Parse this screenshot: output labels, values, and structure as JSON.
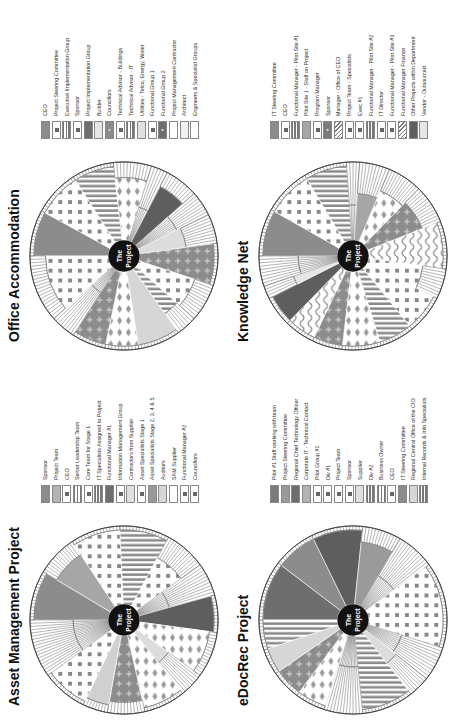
{
  "panels": [
    {
      "id": "asset",
      "title": "Asset Management Project",
      "center_label": [
        "The",
        "Project"
      ],
      "legend": [
        {
          "label": "Sponsor",
          "pattern": "solid",
          "color": "#8c8c8c"
        },
        {
          "label": "Project Team",
          "pattern": "solid",
          "color": "#b3b3b3"
        },
        {
          "label": "CEO",
          "pattern": "cross",
          "color": "#ffffff"
        },
        {
          "label": "Senior Leadership Team",
          "pattern": "hlines",
          "color": "#ffffff"
        },
        {
          "label": "Core Team for Stage 1",
          "pattern": "cross",
          "color": "#ffffff"
        },
        {
          "label": "IT Specialists Assigned to Project",
          "pattern": "hlines",
          "color": "#ffffff"
        },
        {
          "label": "Functional Manager #1",
          "pattern": "solid",
          "color": "#6e6e6e"
        },
        {
          "label": "Information Management Group",
          "pattern": "cross",
          "color": "#ffffff"
        },
        {
          "label": "Contractors from Supplier",
          "pattern": "solid",
          "color": "#e0e0e0"
        },
        {
          "label": "Asset Specialists Stage 1",
          "pattern": "cross",
          "color": "#ffffff"
        },
        {
          "label": "Asset Specialists Stage 2, 3, 4 & 5",
          "pattern": "solid",
          "color": "#999999"
        },
        {
          "label": "Auditors",
          "pattern": "solid",
          "color": "#d6d6d6"
        },
        {
          "label": "SAM Supplier",
          "pattern": "blank",
          "color": "#ffffff"
        },
        {
          "label": "Functional Manager #2",
          "pattern": "cross",
          "color": "#ffffff"
        },
        {
          "label": "Councillors",
          "pattern": "cross",
          "color": "#ffffff"
        }
      ],
      "wedges": [
        {
          "color": "#8c8c8c",
          "pattern": "solid",
          "span": 1.2,
          "depth": 0.95
        },
        {
          "color": "#a6a6a6",
          "pattern": "solid",
          "span": 1.0,
          "depth": 0.8
        },
        {
          "color": "#ffffff",
          "pattern": "dots",
          "span": 1.2,
          "depth": 0.95
        },
        {
          "color": "#9a9a9a",
          "pattern": "vlines",
          "span": 1.2,
          "depth": 0.95
        },
        {
          "color": "#ffffff",
          "pattern": "dots",
          "span": 1.0,
          "depth": 0.7
        },
        {
          "color": "#ffffff",
          "pattern": "hatch",
          "span": 0.8,
          "depth": 0.4
        },
        {
          "color": "#5e5e5e",
          "pattern": "solid",
          "span": 0.9,
          "depth": 0.95
        },
        {
          "color": "#ffffff",
          "pattern": "arrows",
          "span": 1.1,
          "depth": 0.9
        },
        {
          "color": "#dcdcdc",
          "pattern": "solid",
          "span": 0.6,
          "depth": 0.5
        },
        {
          "color": "#ffffff",
          "pattern": "arrows",
          "span": 1.0,
          "depth": 0.95
        },
        {
          "color": "#a0a0a0",
          "pattern": "plus",
          "span": 0.9,
          "depth": 0.85
        },
        {
          "color": "#d0d0d0",
          "pattern": "solid",
          "span": 0.6,
          "depth": 0.9
        },
        {
          "color": "#ffffff",
          "pattern": "dots",
          "span": 1.1,
          "depth": 0.95
        },
        {
          "color": "#ffffff",
          "pattern": "hatch",
          "span": 1.4,
          "depth": 0.45
        }
      ]
    },
    {
      "id": "office",
      "title": "Office Accommodation",
      "center_label": [
        "The",
        "Project"
      ],
      "legend": [
        {
          "label": "CEO",
          "pattern": "solid",
          "color": "#8c8c8c"
        },
        {
          "label": "Project Steering Committee",
          "pattern": "cross",
          "color": "#ffffff"
        },
        {
          "label": "Executive Implementation Group",
          "pattern": "hlines",
          "color": "#ffffff"
        },
        {
          "label": "Sponsor",
          "pattern": "cross",
          "color": "#ffffff"
        },
        {
          "label": "Project Implementation Group",
          "pattern": "solid",
          "color": "#6e6e6e"
        },
        {
          "label": "Builder",
          "pattern": "solid",
          "color": "#e6e6e6"
        },
        {
          "label": "Councillors",
          "pattern": "plus",
          "color": "#8c8c8c"
        },
        {
          "label": "Technical Advisor - Buildings",
          "pattern": "cross",
          "color": "#ffffff"
        },
        {
          "label": "Technical Advisor - IT",
          "pattern": "hlines",
          "color": "#ffffff"
        },
        {
          "label": "Utilities - Telco, Energy, Water",
          "pattern": "solid",
          "color": "#e0e0e0"
        },
        {
          "label": "Functional Group 1",
          "pattern": "cross",
          "color": "#ffffff"
        },
        {
          "label": "Functional Group 2",
          "pattern": "plus",
          "color": "#6e6e6e"
        },
        {
          "label": "Project Management Contractor",
          "pattern": "blank",
          "color": "#ffffff"
        },
        {
          "label": "Architect",
          "pattern": "blank",
          "color": "#f0f0f0"
        },
        {
          "label": "Engineers & Specialist Groups",
          "pattern": "blank",
          "color": "#ffffff"
        }
      ],
      "wedges": [
        {
          "color": "#8c8c8c",
          "pattern": "solid",
          "span": 1.1,
          "depth": 0.95
        },
        {
          "color": "#ffffff",
          "pattern": "dots",
          "span": 1.1,
          "depth": 0.95
        },
        {
          "color": "#9a9a9a",
          "pattern": "vlines",
          "span": 1.0,
          "depth": 0.95
        },
        {
          "color": "#ffffff",
          "pattern": "arrows",
          "span": 0.9,
          "depth": 0.8
        },
        {
          "color": "#ffffff",
          "pattern": "hatch",
          "span": 0.4,
          "depth": 0.45
        },
        {
          "color": "#5e5e5e",
          "pattern": "solid",
          "span": 0.8,
          "depth": 0.8
        },
        {
          "color": "#ffffff",
          "pattern": "hatch",
          "span": 0.6,
          "depth": 0.55
        },
        {
          "color": "#dcdcdc",
          "pattern": "solid",
          "span": 0.7,
          "depth": 0.6
        },
        {
          "color": "#8c8c8c",
          "pattern": "plus",
          "span": 1.0,
          "depth": 0.95
        },
        {
          "color": "#ffffff",
          "pattern": "dots",
          "span": 0.9,
          "depth": 0.75
        },
        {
          "color": "#9a9a9a",
          "pattern": "vlines",
          "span": 0.5,
          "depth": 0.7
        },
        {
          "color": "#d6d6d6",
          "pattern": "solid",
          "span": 1.0,
          "depth": 0.95
        },
        {
          "color": "#ffffff",
          "pattern": "arrows",
          "span": 0.8,
          "depth": 0.95
        },
        {
          "color": "#7a7a7a",
          "pattern": "plus",
          "span": 0.8,
          "depth": 0.95
        },
        {
          "color": "#ffffff",
          "pattern": "hatch",
          "span": 0.6,
          "depth": 0.35
        },
        {
          "color": "#f4f4f4",
          "pattern": "dots",
          "span": 1.6,
          "depth": 0.8
        }
      ]
    },
    {
      "id": "edocrec",
      "title": "eDocRec Project",
      "center_label": [
        "The",
        "Project"
      ],
      "legend": [
        {
          "label": "Pilot #1 Staff working with team",
          "pattern": "solid",
          "color": "#7a7a7a"
        },
        {
          "label": "Project Steering Committee",
          "pattern": "solid",
          "color": "#9a9a9a"
        },
        {
          "label": "Regional Chief Technology Officer",
          "pattern": "solid",
          "color": "#6e6e6e"
        },
        {
          "label": "Corporate IT - Technical Contact",
          "pattern": "solid",
          "color": "#b3b3b3"
        },
        {
          "label": "Pilot Group #1",
          "pattern": "cross",
          "color": "#ffffff"
        },
        {
          "label": "Div #1",
          "pattern": "cross",
          "color": "#ffffff"
        },
        {
          "label": "Project Team",
          "pattern": "cross",
          "color": "#ffffff"
        },
        {
          "label": "Sponsor",
          "pattern": "cross",
          "color": "#ffffff"
        },
        {
          "label": "Supplier",
          "pattern": "solid",
          "color": "#e0e0e0"
        },
        {
          "label": "Div #2",
          "pattern": "hlines",
          "color": "#ffffff"
        },
        {
          "label": "Business Owner",
          "pattern": "hlines",
          "color": "#ffffff"
        },
        {
          "label": "CEO",
          "pattern": "cross",
          "color": "#ffffff"
        },
        {
          "label": "IT Steering Committee",
          "pattern": "solid",
          "color": "#8c8c8c"
        },
        {
          "label": "Regional Central Office of the CIO",
          "pattern": "solid",
          "color": "#d6d6d6"
        },
        {
          "label": "Internal Records & Info Specialists",
          "pattern": "hlines",
          "color": "#ffffff"
        }
      ],
      "wedges": [
        {
          "color": "#6e6e6e",
          "pattern": "solid",
          "span": 1.4,
          "depth": 0.95
        },
        {
          "color": "#8c8c8c",
          "pattern": "solid",
          "span": 1.0,
          "depth": 0.95
        },
        {
          "color": "#5e5e5e",
          "pattern": "solid",
          "span": 1.2,
          "depth": 0.95
        },
        {
          "color": "#9a9a9a",
          "pattern": "solid",
          "span": 0.9,
          "depth": 0.8
        },
        {
          "color": "#ffffff",
          "pattern": "hatch",
          "span": 0.9,
          "depth": 0.45
        },
        {
          "color": "#ffffff",
          "pattern": "dots",
          "span": 2.0,
          "depth": 0.95
        },
        {
          "color": "#ffffff",
          "pattern": "hatch",
          "span": 0.8,
          "depth": 0.45
        },
        {
          "color": "#dcdcdc",
          "pattern": "solid",
          "span": 0.5,
          "depth": 0.5
        },
        {
          "color": "#9a9a9a",
          "pattern": "vlines",
          "span": 1.2,
          "depth": 0.95
        },
        {
          "color": "#ffffff",
          "pattern": "hatch",
          "span": 0.9,
          "depth": 0.4
        },
        {
          "color": "#ffffff",
          "pattern": "arrows",
          "span": 0.7,
          "depth": 0.95
        },
        {
          "color": "#8c8c8c",
          "pattern": "plus",
          "span": 0.7,
          "depth": 0.95
        },
        {
          "color": "#d6d6d6",
          "pattern": "solid",
          "span": 0.6,
          "depth": 0.95
        },
        {
          "color": "#ffffff",
          "pattern": "vlines",
          "span": 0.7,
          "depth": 0.95
        }
      ]
    },
    {
      "id": "knowledge",
      "title": "Knowledge Net",
      "center_label": [
        "The",
        "Project"
      ],
      "legend": [
        {
          "label": "IT Steering Committee",
          "pattern": "solid",
          "color": "#8c8c8c"
        },
        {
          "label": "CEO",
          "pattern": "cross",
          "color": "#ffffff"
        },
        {
          "label": "Functional Manager - Pilot Site #1",
          "pattern": "hlines",
          "color": "#ffffff"
        },
        {
          "label": "Pilot Site 1 - Staff on Project",
          "pattern": "solid",
          "color": "#a6a6a6"
        },
        {
          "label": "Program Manager",
          "pattern": "cross",
          "color": "#ffffff"
        },
        {
          "label": "Sponsor",
          "pattern": "plus",
          "color": "#7a7a7a"
        },
        {
          "label": "Manager - Office of CEO",
          "pattern": "waves",
          "color": "#ffffff"
        },
        {
          "label": "Project Team - Specialists",
          "pattern": "cross",
          "color": "#ffffff"
        },
        {
          "label": "Exec #1",
          "pattern": "cross",
          "color": "#6e6e6e"
        },
        {
          "label": "Functional Manager - Pilot Site #2",
          "pattern": "hlines",
          "color": "#ffffff"
        },
        {
          "label": "IT Director",
          "pattern": "cross",
          "color": "#7a7a7a"
        },
        {
          "label": "Functional Manager - Pilot Site #3",
          "pattern": "cross",
          "color": "#ffffff"
        },
        {
          "label": "Functional Manager Finance",
          "pattern": "waves",
          "color": "#ffffff"
        },
        {
          "label": "Other Projects within Department",
          "pattern": "solid",
          "color": "#5e5e5e"
        },
        {
          "label": "Vendor - Outsourced",
          "pattern": "solid",
          "color": "#e6e6e6"
        }
      ],
      "wedges": [
        {
          "color": "#8c8c8c",
          "pattern": "solid",
          "span": 1.1,
          "depth": 0.95
        },
        {
          "color": "#ffffff",
          "pattern": "dots",
          "span": 1.1,
          "depth": 0.95
        },
        {
          "color": "#9a9a9a",
          "pattern": "vlines",
          "span": 1.0,
          "depth": 0.95
        },
        {
          "color": "#ffffff",
          "pattern": "hatch",
          "span": 0.3,
          "depth": 0.45
        },
        {
          "color": "#a6a6a6",
          "pattern": "solid",
          "span": 0.7,
          "depth": 0.6
        },
        {
          "color": "#ffffff",
          "pattern": "arrows",
          "span": 0.8,
          "depth": 0.7
        },
        {
          "color": "#7a7a7a",
          "pattern": "plus",
          "span": 0.9,
          "depth": 0.75
        },
        {
          "color": "#ffffff",
          "pattern": "waves",
          "span": 1.1,
          "depth": 0.95
        },
        {
          "color": "#ffffff",
          "pattern": "dots",
          "span": 0.7,
          "depth": 0.7
        },
        {
          "color": "#8c8c8c",
          "pattern": "dots",
          "span": 0.9,
          "depth": 0.95
        },
        {
          "color": "#9a9a9a",
          "pattern": "vlines",
          "span": 0.8,
          "depth": 0.95
        },
        {
          "color": "#8c8c8c",
          "pattern": "arrows",
          "span": 0.9,
          "depth": 0.95
        },
        {
          "color": "#ffffff",
          "pattern": "plus",
          "span": 0.7,
          "depth": 0.95
        },
        {
          "color": "#ffffff",
          "pattern": "waves",
          "span": 0.7,
          "depth": 0.95
        },
        {
          "color": "#5e5e5e",
          "pattern": "solid",
          "span": 0.7,
          "depth": 0.95
        },
        {
          "color": "#e6e6e6",
          "pattern": "solid",
          "span": 0.3,
          "depth": 0.6
        },
        {
          "color": "#ffffff",
          "pattern": "hatch",
          "span": 0.7,
          "depth": 0.5
        }
      ]
    }
  ]
}
